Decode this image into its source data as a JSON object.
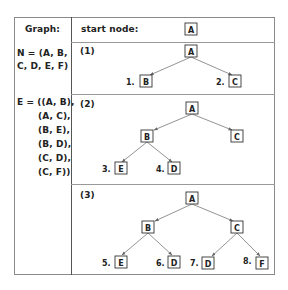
{
  "left_column": {
    "header": "Graph:",
    "nodes_label": "N = (A, B,",
    "nodes_label_2": "C, D, E, F)",
    "edges_label": "E = ((A, B),",
    "edges": [
      "(A, C),",
      "(B, E),",
      "(B, D),",
      "(C, D),",
      "(C, F))"
    ]
  },
  "right_column": {
    "header": "start node:",
    "start_node": "A",
    "panels": [
      {
        "label": "(1)",
        "root": "A",
        "children": [
          {
            "order": "1.",
            "node": "B"
          },
          {
            "order": "2.",
            "node": "C"
          }
        ]
      },
      {
        "label": "(2)",
        "root": "A",
        "level1": [
          "B",
          "C"
        ],
        "children": [
          {
            "order": "3.",
            "node": "E"
          },
          {
            "order": "4.",
            "node": "D"
          }
        ]
      },
      {
        "label": "(3)",
        "root": "A",
        "level1": [
          "B",
          "C"
        ],
        "children": [
          {
            "order": "5.",
            "node": "E"
          },
          {
            "order": "6.",
            "node": "D"
          },
          {
            "order": "7.",
            "node": "D"
          },
          {
            "order": "8.",
            "node": "F"
          }
        ]
      }
    ]
  }
}
